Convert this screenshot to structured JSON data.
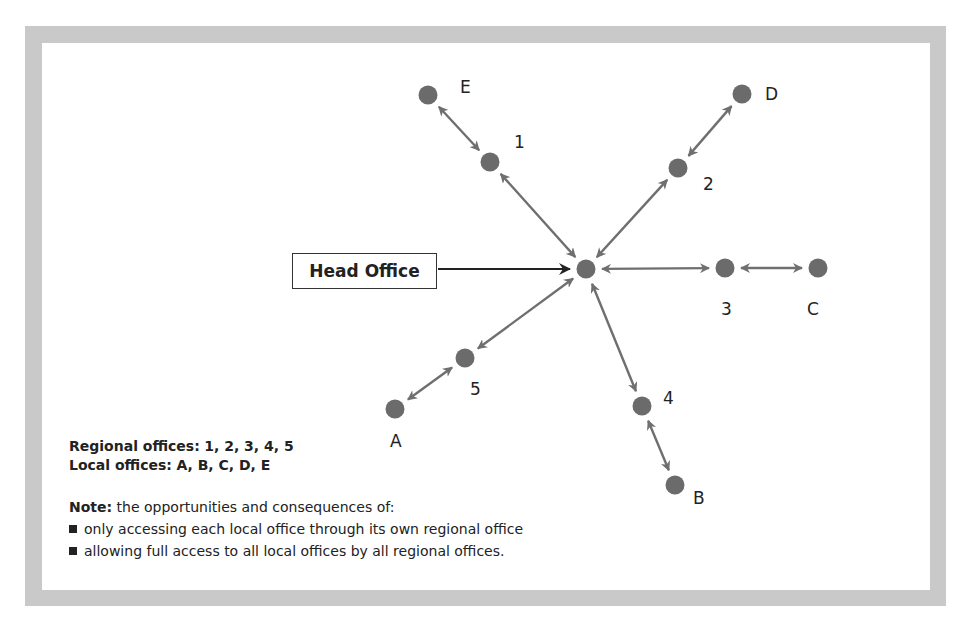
{
  "head_office": {
    "label": "Head Office"
  },
  "nodes": {
    "hub": {
      "x": 586,
      "y": 269
    },
    "regional": [
      {
        "id": "1",
        "label": "1",
        "x": 490,
        "y": 162,
        "lx": 514,
        "ly": 148
      },
      {
        "id": "2",
        "label": "2",
        "x": 678,
        "y": 168,
        "lx": 703,
        "ly": 190
      },
      {
        "id": "3",
        "label": "3",
        "x": 725,
        "y": 268,
        "lx": 721,
        "ly": 315
      },
      {
        "id": "4",
        "label": "4",
        "x": 642,
        "y": 406,
        "lx": 663,
        "ly": 404
      },
      {
        "id": "5",
        "label": "5",
        "x": 465,
        "y": 358,
        "lx": 470,
        "ly": 395
      }
    ],
    "local": [
      {
        "id": "A",
        "label": "A",
        "x": 395,
        "y": 409,
        "lx": 390,
        "ly": 447
      },
      {
        "id": "B",
        "label": "B",
        "x": 675,
        "y": 485,
        "lx": 693,
        "ly": 504
      },
      {
        "id": "C",
        "label": "C",
        "x": 818,
        "y": 268,
        "lx": 807,
        "ly": 315
      },
      {
        "id": "D",
        "label": "D",
        "x": 742,
        "y": 94,
        "lx": 765,
        "ly": 100
      },
      {
        "id": "E",
        "label": "E",
        "x": 428,
        "y": 95,
        "lx": 460,
        "ly": 93
      }
    ]
  },
  "legend": {
    "regional_label": "Regional offices:",
    "regional_values": "1, 2, 3, 4, 5",
    "local_label": "Local offices:",
    "local_values": "A, B, C, D, E"
  },
  "note": {
    "label": "Note:",
    "intro": "the opportunities and consequences of:",
    "bullets": [
      "only accessing each local office through its own regional office",
      "allowing full access to all local offices by all regional offices."
    ]
  },
  "colors": {
    "frame": "#c9c9c9",
    "node": "#6b6b6b",
    "arrow": "#6f6f6f",
    "text": "#222222"
  }
}
